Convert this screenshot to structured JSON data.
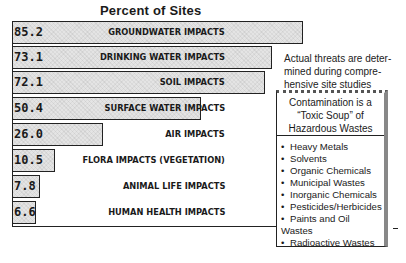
{
  "chart_data": {
    "type": "bar",
    "orientation": "horizontal",
    "title": "Percent of Sites",
    "xlabel": "",
    "ylabel": "",
    "xlim": [
      0,
      100
    ],
    "grid": false,
    "categories": [
      "GROUNDWATER IMPACTS",
      "DRINKING WATER IMPACTS",
      "SOIL IMPACTS",
      "SURFACE WATER IMPACTS",
      "AIR IMPACTS",
      "FLORA IMPACTS (VEGETATION)",
      "ANIMAL LIFE IMPACTS",
      "HUMAN HEALTH IMPACTS"
    ],
    "values": [
      85.2,
      73.1,
      72.1,
      50.4,
      26.0,
      10.5,
      7.8,
      6.6
    ],
    "value_labels": [
      "85.2",
      "73.1",
      "72.1",
      "50.4",
      "26.0",
      "10.5",
      "7.8",
      "6.6"
    ],
    "annotations": [
      "Actual threats are determined during comprehensive site studies"
    ]
  },
  "title": "Percent of Sites",
  "bars": [
    {
      "value": "85.2",
      "label": "GROUNDWATER IMPACTS",
      "width_px": 291
    },
    {
      "value": "73.1",
      "label": "DRINKING WATER IMPACTS",
      "width_px": 260
    },
    {
      "value": "72.1",
      "label": "SOIL IMPACTS",
      "width_px": 253
    },
    {
      "value": "50.4",
      "label": "SURFACE WATER IMPACTS",
      "width_px": 189
    },
    {
      "value": "26.0",
      "label": "AIR IMPACTS",
      "width_px": 91
    },
    {
      "value": "10.5",
      "label": "FLORA IMPACTS (VEGETATION)",
      "width_px": 43
    },
    {
      "value": "7.8",
      "label": "ANIMAL LIFE IMPACTS",
      "width_px": 28
    },
    {
      "value": "6.6",
      "label": "HUMAN HEALTH IMPACTS",
      "width_px": 24
    }
  ],
  "note": "Actual threats are determined during comprehensive site studies",
  "note_lines": [
    "Actual threats are deter-",
    "mined during compre-",
    "hensive site studies"
  ],
  "box": {
    "heading_lines": [
      "Contamination is a",
      "“Toxic Soup” of",
      "Hazardous Wastes"
    ],
    "items": [
      "Heavy Metals",
      "Solvents",
      "Organic Chemicals",
      "Municipal Wastes",
      "Inorganic Chemicals",
      "Pesticides/Herbicides",
      "Paints and Oil Wastes",
      "Radioactive Wastes"
    ]
  }
}
